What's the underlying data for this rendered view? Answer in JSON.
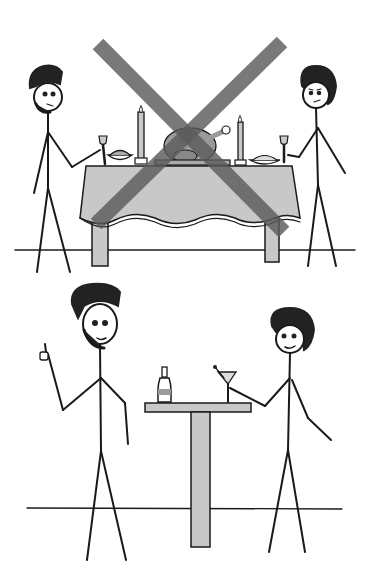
{
  "illustration": {
    "description": "Two-panel stick figure comic: top panel formal dinner crossed out, bottom panel casual drinks",
    "colors": {
      "background": "#ffffff",
      "line": "#1a1a1a",
      "table_gray": "#c8c8c8",
      "cross_gray": "#6e6e6e",
      "hair": "#222222"
    },
    "top_panel": {
      "scene": "formal-dinner",
      "crossed_out": true,
      "items": [
        "man-left",
        "woman-right",
        "dining-table",
        "turkey",
        "candles",
        "wine-glasses",
        "bowls"
      ]
    },
    "bottom_panel": {
      "scene": "casual-drinks",
      "crossed_out": false,
      "items": [
        "man-thumbs-up",
        "woman-with-martini",
        "bar-table",
        "bottle",
        "martini-glass"
      ]
    }
  }
}
